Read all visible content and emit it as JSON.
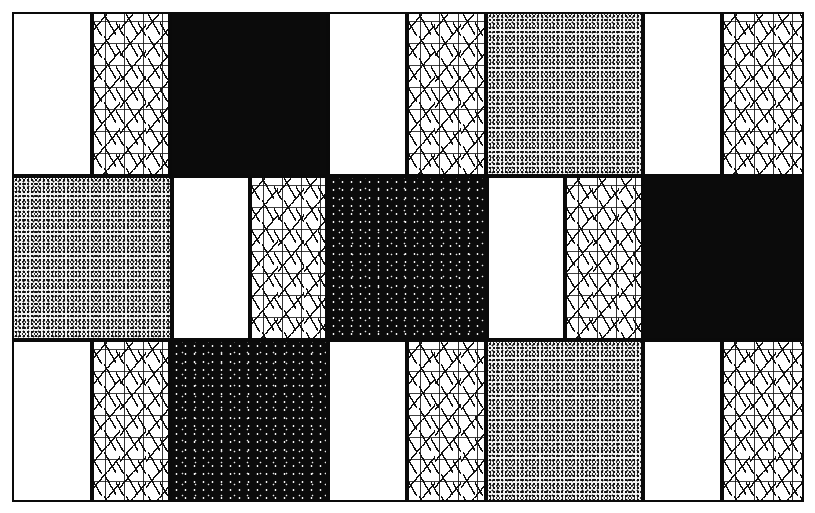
{
  "figure": {
    "colors": {
      "ink": "#0a0a0a",
      "paper": "#ffffff"
    },
    "rows": [
      {
        "cells": [
          {
            "x": 12,
            "w": 80,
            "texture": "blank"
          },
          {
            "x": 92,
            "w": 78,
            "texture": "dash"
          },
          {
            "x": 170,
            "w": 158,
            "texture": "black"
          },
          {
            "x": 328,
            "w": 79,
            "texture": "blank"
          },
          {
            "x": 407,
            "w": 79,
            "texture": "dash"
          },
          {
            "x": 486,
            "w": 157,
            "texture": "stipple"
          },
          {
            "x": 643,
            "w": 79,
            "texture": "blank"
          },
          {
            "x": 722,
            "w": 82,
            "texture": "dash"
          }
        ]
      },
      {
        "cells": [
          {
            "x": 12,
            "w": 160,
            "texture": "stipple"
          },
          {
            "x": 172,
            "w": 78,
            "texture": "blank"
          },
          {
            "x": 250,
            "w": 77,
            "texture": "dash"
          },
          {
            "x": 327,
            "w": 160,
            "texture": "speckle"
          },
          {
            "x": 487,
            "w": 78,
            "texture": "blank"
          },
          {
            "x": 565,
            "w": 78,
            "texture": "dash"
          },
          {
            "x": 643,
            "w": 161,
            "texture": "black"
          }
        ]
      },
      {
        "cells": [
          {
            "x": 12,
            "w": 80,
            "texture": "blank"
          },
          {
            "x": 92,
            "w": 78,
            "texture": "dash"
          },
          {
            "x": 170,
            "w": 158,
            "texture": "speckle"
          },
          {
            "x": 328,
            "w": 79,
            "texture": "blank"
          },
          {
            "x": 407,
            "w": 79,
            "texture": "dash"
          },
          {
            "x": 486,
            "w": 157,
            "texture": "stipple"
          },
          {
            "x": 643,
            "w": 79,
            "texture": "blank"
          },
          {
            "x": 722,
            "w": 82,
            "texture": "dash"
          }
        ]
      }
    ],
    "row_bounds": [
      [
        12,
        176
      ],
      [
        176,
        340
      ],
      [
        340,
        502
      ]
    ]
  }
}
